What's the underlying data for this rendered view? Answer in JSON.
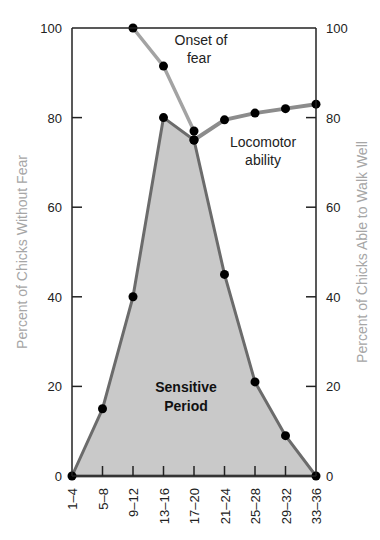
{
  "chart_data": {
    "type": "line",
    "title": "",
    "xlabel": "",
    "ylabel": "Percent of Chicks Without Fear",
    "ylabel_right": "Percent of Chicks Able to Walk Well",
    "categories": [
      "1–4",
      "5–8",
      "9–12",
      "13–16",
      "17–20",
      "21–24",
      "25–28",
      "29–32",
      "33–36"
    ],
    "ylim": [
      0,
      100
    ],
    "yticks": [
      0,
      20,
      40,
      60,
      80,
      100
    ],
    "yticks_right": [
      0,
      20,
      40,
      60,
      80,
      100
    ],
    "grid": false,
    "series": [
      {
        "name": "Sensitive Period (Percent of Chicks Without Fear)",
        "style": "filled-area",
        "values": [
          0,
          15,
          40,
          80,
          75,
          45,
          21,
          9,
          0
        ]
      },
      {
        "name": "Onset of fear",
        "style": "line",
        "values": [
          null,
          null,
          100,
          91.5,
          77,
          null,
          null,
          null,
          null
        ]
      },
      {
        "name": "Locomotor ability",
        "style": "line",
        "axis": "right",
        "values": [
          null,
          null,
          null,
          null,
          75,
          79.5,
          81,
          82,
          83
        ]
      }
    ],
    "annotations": [
      {
        "text": "Onset of fear",
        "lines": [
          "Onset of",
          "fear"
        ]
      },
      {
        "text": "Locomotor ability",
        "lines": [
          "Locomotor",
          "ability"
        ]
      },
      {
        "text": "Sensitive Period",
        "lines": [
          "Sensitive",
          "Period"
        ]
      }
    ]
  },
  "labels": {
    "y_left_title": "Percent of Chicks Without Fear",
    "y_right_title": "Percent of Chicks Able to Walk Well",
    "y_ticks": [
      "0",
      "20",
      "40",
      "60",
      "80",
      "100"
    ],
    "x_ticks": [
      "1–4",
      "5–8",
      "9–12",
      "13–16",
      "17–20",
      "21–24",
      "25–28",
      "29–32",
      "33–36"
    ],
    "onset_line1": "Onset of",
    "onset_line2": "fear",
    "loco_line1": "Locomotor",
    "loco_line2": "ability",
    "sens_line1": "Sensitive",
    "sens_line2": "Period"
  },
  "colors": {
    "fill": "#c9c9c9",
    "fill_edge": "#6b6b6b",
    "onset_line": "#a3a3a3",
    "loco_line": "#8c8c8c",
    "point": "#000000",
    "axis": "#222222",
    "axis_title": "#a6a6a6"
  }
}
